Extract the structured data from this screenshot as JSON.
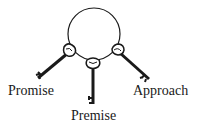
{
  "diagram": {
    "type": "key-ring",
    "ring": {
      "cx": 94,
      "cy": 34,
      "r": 26
    },
    "keys": [
      {
        "id": "left",
        "label": "Promise"
      },
      {
        "id": "bottom",
        "label": "Premise"
      },
      {
        "id": "right",
        "label": "Approach"
      }
    ],
    "colors": {
      "stroke": "#1a1a1a",
      "background": "#ffffff"
    }
  }
}
